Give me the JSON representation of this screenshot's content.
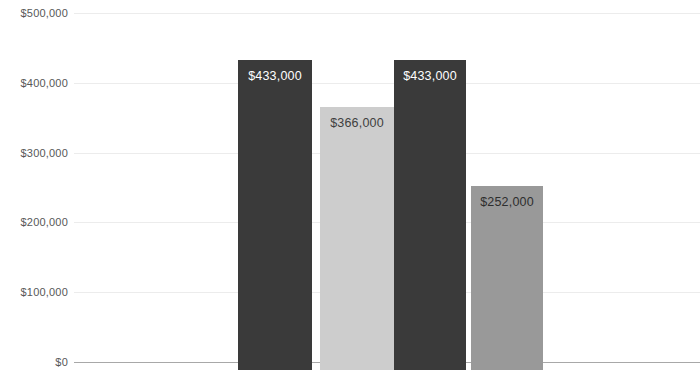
{
  "chart_data": {
    "type": "bar",
    "title": "",
    "subtitle": "",
    "xlabel": "",
    "ylabel": "",
    "categories": [
      "",
      "",
      "",
      ""
    ],
    "values": [
      433000,
      366000,
      433000,
      252000
    ],
    "value_labels": [
      "$433,000",
      "$366,000",
      "$433,000",
      "$252,000"
    ],
    "bar_colors": [
      "#3a3a3a",
      "#cdcdcd",
      "#3a3a3a",
      "#999999"
    ],
    "bar_label_colors": [
      "#ffffff",
      "#404040",
      "#ffffff",
      "#2e2e2e"
    ],
    "ylim": [
      0,
      500000
    ],
    "yticks": [
      500000,
      400000,
      300000,
      200000,
      100000,
      0
    ],
    "ytick_labels": [
      "$500,000",
      "$400,000",
      "$300,000",
      "$200,000",
      "$100,000",
      "$0"
    ],
    "grid": true,
    "grid_color": "#ececec",
    "axis_color": "#a8a8a8",
    "legend": null,
    "legend_position": "none",
    "annotations": []
  },
  "plot": {
    "x_left": 74,
    "x_right": 700,
    "y_top_px": 13,
    "y_zero_px": 362,
    "bars_geometry": [
      {
        "left": 238,
        "width": 74
      },
      {
        "left": 320,
        "width": 74
      },
      {
        "left": 394,
        "width": 72
      },
      {
        "left": 471,
        "width": 72
      }
    ]
  }
}
